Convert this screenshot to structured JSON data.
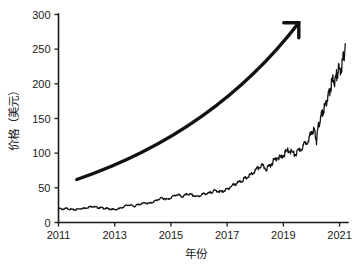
{
  "chart_data": {
    "type": "line",
    "title": "",
    "xlabel": "年份",
    "ylabel": "价格（美元）",
    "xlim": [
      2011.0,
      2021.3
    ],
    "ylim": [
      0,
      300
    ],
    "grid": false,
    "legend": null,
    "xticks": [
      2011,
      2013,
      2015,
      2017,
      2019,
      2021
    ],
    "xtick_labels": [
      "2011",
      "2013",
      "2015",
      "2017",
      "2019",
      "2021"
    ],
    "yticks": [
      0,
      50,
      100,
      150,
      200,
      250,
      300
    ],
    "ytick_labels": [
      "0",
      "50",
      "100",
      "150",
      "200",
      "250",
      "300"
    ],
    "line_color": "#111111",
    "background_color": "#ffffff",
    "series": [
      {
        "name": "价格",
        "x": [
          2011.0,
          2011.1,
          2011.2,
          2011.3,
          2011.4,
          2011.5,
          2011.6,
          2011.7,
          2011.8,
          2011.9,
          2012.0,
          2012.1,
          2012.2,
          2012.3,
          2012.4,
          2012.5,
          2012.6,
          2012.7,
          2012.8,
          2012.9,
          2013.0,
          2013.1,
          2013.2,
          2013.3,
          2013.4,
          2013.5,
          2013.6,
          2013.7,
          2013.8,
          2013.9,
          2014.0,
          2014.1,
          2014.2,
          2014.3,
          2014.4,
          2014.5,
          2014.6,
          2014.7,
          2014.8,
          2014.9,
          2015.0,
          2015.1,
          2015.2,
          2015.3,
          2015.4,
          2015.5,
          2015.6,
          2015.7,
          2015.8,
          2015.9,
          2016.0,
          2016.1,
          2016.2,
          2016.3,
          2016.4,
          2016.5,
          2016.6,
          2016.7,
          2016.8,
          2016.9,
          2017.0,
          2017.1,
          2017.2,
          2017.3,
          2017.4,
          2017.5,
          2017.6,
          2017.7,
          2017.8,
          2017.9,
          2018.0,
          2018.1,
          2018.2,
          2018.3,
          2018.4,
          2018.5,
          2018.6,
          2018.7,
          2018.8,
          2018.9,
          2019.0,
          2019.1,
          2019.2,
          2019.3,
          2019.4,
          2019.5,
          2019.6,
          2019.7,
          2019.8,
          2019.9,
          2020.0,
          2020.06,
          2020.12,
          2020.18,
          2020.24,
          2020.3,
          2020.36,
          2020.42,
          2020.48,
          2020.54,
          2020.6,
          2020.66,
          2020.72,
          2020.78,
          2020.84,
          2020.9,
          2020.96,
          2021.02,
          2021.08,
          2021.14,
          2021.2
        ],
        "y": [
          21,
          20,
          20,
          21,
          20,
          19,
          19,
          20,
          21,
          21,
          22,
          23,
          24,
          23,
          22,
          22,
          21,
          21,
          20,
          20,
          19,
          20,
          21,
          23,
          25,
          26,
          25,
          24,
          26,
          27,
          28,
          29,
          28,
          29,
          31,
          33,
          35,
          36,
          35,
          34,
          37,
          39,
          41,
          40,
          38,
          40,
          42,
          41,
          40,
          38,
          39,
          41,
          43,
          42,
          44,
          46,
          47,
          46,
          45,
          47,
          49,
          52,
          55,
          57,
          59,
          61,
          64,
          66,
          69,
          72,
          76,
          80,
          84,
          82,
          79,
          83,
          88,
          93,
          97,
          95,
          99,
          104,
          107,
          104,
          100,
          103,
          108,
          112,
          118,
          124,
          130,
          137,
          133,
          120,
          140,
          150,
          158,
          164,
          172,
          178,
          186,
          196,
          205,
          212,
          208,
          218,
          226,
          222,
          232,
          243,
          258
        ]
      }
    ],
    "annotations": [
      {
        "name": "growth-trend-arrow",
        "kind": "curved-arrow",
        "description": "上升趋势箭头",
        "start": [
          2011.65,
          62
        ],
        "end": [
          2019.55,
          288
        ],
        "color": "#111111"
      }
    ]
  }
}
